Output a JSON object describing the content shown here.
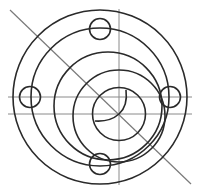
{
  "diagram": {
    "width": 197,
    "height": 195,
    "background": "#ffffff",
    "stroke_color": "#2a2a2a",
    "guide_color": "#8a8a8a",
    "guide_lines": [
      {
        "name": "horizontal-centerline-upper",
        "x1": 8,
        "y1": 97,
        "x2": 192,
        "y2": 97
      },
      {
        "name": "horizontal-centerline-lower",
        "x1": 8,
        "y1": 114,
        "x2": 192,
        "y2": 114
      },
      {
        "name": "vertical-centerline",
        "x1": 119,
        "y1": 9,
        "x2": 119,
        "y2": 185
      }
    ],
    "diagonal_line": {
      "name": "diagonal-line",
      "x1": 10,
      "y1": 10,
      "x2": 191,
      "y2": 184
    },
    "circles": [
      {
        "name": "outer-ring",
        "cx": 100,
        "cy": 97,
        "r": 87
      },
      {
        "name": "bolt-circle-ring",
        "cx": 100,
        "cy": 97,
        "r": 69
      },
      {
        "name": "offset-circle-large",
        "cx": 108,
        "cy": 106,
        "r": 54
      },
      {
        "name": "offset-circle-medium",
        "cx": 119,
        "cy": 116,
        "r": 46
      },
      {
        "name": "inner-circle",
        "cx": 119,
        "cy": 114,
        "r": 26.5
      },
      {
        "name": "bolt-hole-top",
        "cx": 100,
        "cy": 29,
        "r": 10.5
      },
      {
        "name": "bolt-hole-left",
        "cx": 30,
        "cy": 97,
        "r": 10.5
      },
      {
        "name": "bolt-hole-right",
        "cx": 170,
        "cy": 97,
        "r": 10.5
      },
      {
        "name": "bolt-hole-bottom",
        "cx": 100,
        "cy": 164,
        "r": 10.5
      }
    ],
    "arcs": [
      {
        "name": "inner-crescent-arc",
        "d": "M 126 90 Q 128 106 119 114 Q 110 122 95 121"
      }
    ]
  }
}
